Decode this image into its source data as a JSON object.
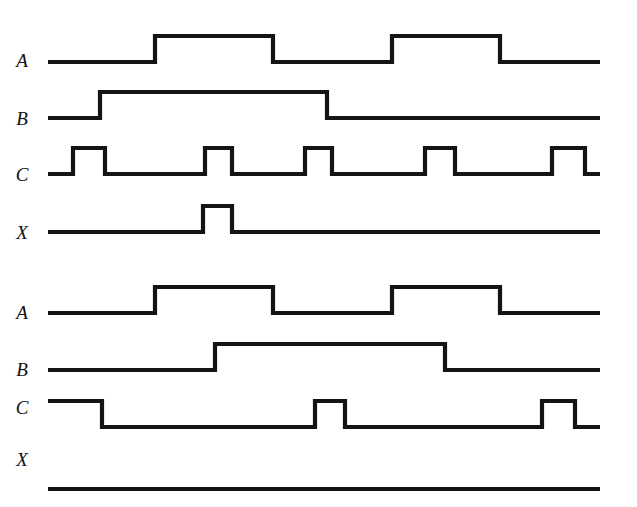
{
  "figure": {
    "type": "digital-timing-diagram",
    "title": "",
    "width": 637,
    "height": 507,
    "background_color": "#ffffff",
    "line_color": "#141414",
    "line_width": 4.2,
    "x_start": 48,
    "x_end": 600,
    "signal_high_offset": -26
  },
  "groups": [
    {
      "name": "upper-timing-group",
      "signals": [
        {
          "label": "A",
          "label_x": 22,
          "label_y": 62,
          "baseline_y": 62,
          "initial_level": "low",
          "transitions": [
            155,
            273,
            392,
            500
          ],
          "segments": [
            {
              "level": "low",
              "from": 48,
              "to": 155
            },
            {
              "level": "high",
              "from": 155,
              "to": 273
            },
            {
              "level": "low",
              "from": 273,
              "to": 392
            },
            {
              "level": "high",
              "from": 392,
              "to": 500
            },
            {
              "level": "low",
              "from": 500,
              "to": 600
            }
          ]
        },
        {
          "label": "B",
          "label_x": 22,
          "label_y": 120,
          "baseline_y": 118,
          "initial_level": "low",
          "transitions": [
            100,
            327
          ],
          "segments": [
            {
              "level": "low",
              "from": 48,
              "to": 100
            },
            {
              "level": "high",
              "from": 100,
              "to": 327
            },
            {
              "level": "low",
              "from": 327,
              "to": 600
            }
          ]
        },
        {
          "label": "C",
          "label_x": 22,
          "label_y": 176,
          "baseline_y": 174,
          "initial_level": "low",
          "transitions": [
            73,
            105,
            205,
            232,
            305,
            332,
            425,
            455,
            552,
            585
          ],
          "segments": [
            {
              "level": "low",
              "from": 48,
              "to": 73
            },
            {
              "level": "high",
              "from": 73,
              "to": 105
            },
            {
              "level": "low",
              "from": 105,
              "to": 205
            },
            {
              "level": "high",
              "from": 205,
              "to": 232
            },
            {
              "level": "low",
              "from": 232,
              "to": 305
            },
            {
              "level": "high",
              "from": 305,
              "to": 332
            },
            {
              "level": "low",
              "from": 332,
              "to": 425
            },
            {
              "level": "high",
              "from": 425,
              "to": 455
            },
            {
              "level": "low",
              "from": 455,
              "to": 552
            },
            {
              "level": "high",
              "from": 552,
              "to": 585
            },
            {
              "level": "low",
              "from": 585,
              "to": 600
            }
          ]
        },
        {
          "label": "X",
          "label_x": 22,
          "label_y": 234,
          "baseline_y": 232,
          "initial_level": "low",
          "transitions": [
            203,
            232
          ],
          "segments": [
            {
              "level": "low",
              "from": 48,
              "to": 203
            },
            {
              "level": "high",
              "from": 203,
              "to": 232
            },
            {
              "level": "low",
              "from": 232,
              "to": 600
            }
          ]
        }
      ]
    },
    {
      "name": "lower-timing-group",
      "signals": [
        {
          "label": "A",
          "label_x": 22,
          "label_y": 314,
          "baseline_y": 313,
          "initial_level": "low",
          "transitions": [
            155,
            273,
            392,
            500
          ],
          "segments": [
            {
              "level": "low",
              "from": 48,
              "to": 155
            },
            {
              "level": "high",
              "from": 155,
              "to": 273
            },
            {
              "level": "low",
              "from": 273,
              "to": 392
            },
            {
              "level": "high",
              "from": 392,
              "to": 500
            },
            {
              "level": "low",
              "from": 500,
              "to": 600
            }
          ]
        },
        {
          "label": "B",
          "label_x": 22,
          "label_y": 371,
          "baseline_y": 370,
          "initial_level": "low",
          "transitions": [
            215,
            445
          ],
          "segments": [
            {
              "level": "low",
              "from": 48,
              "to": 215
            },
            {
              "level": "high",
              "from": 215,
              "to": 445
            },
            {
              "level": "low",
              "from": 445,
              "to": 600
            }
          ]
        },
        {
          "label": "C",
          "label_x": 22,
          "label_y": 409,
          "baseline_y": 427,
          "initial_level": "high",
          "transitions": [
            102,
            315,
            345,
            542,
            575
          ],
          "segments": [
            {
              "level": "high",
              "from": 48,
              "to": 102
            },
            {
              "level": "low",
              "from": 102,
              "to": 315
            },
            {
              "level": "high",
              "from": 315,
              "to": 345
            },
            {
              "level": "low",
              "from": 345,
              "to": 542
            },
            {
              "level": "high",
              "from": 542,
              "to": 575
            },
            {
              "level": "low",
              "from": 575,
              "to": 600
            }
          ]
        },
        {
          "label": "X",
          "label_x": 22,
          "label_y": 461,
          "baseline_y": 489,
          "initial_level": "low",
          "transitions": [],
          "segments": [
            {
              "level": "low",
              "from": 48,
              "to": 600
            }
          ]
        }
      ]
    }
  ]
}
